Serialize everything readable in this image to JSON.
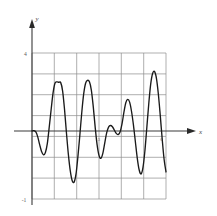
{
  "figure": {
    "background_color": "#ffffff",
    "curve_color": "#1a1a1a",
    "grid_color": "#8d8d8d",
    "axis_color": "#3a3a3a",
    "axis_labels": {
      "x": "x",
      "y": "y"
    },
    "tick_labels": {
      "y_top": "4",
      "y_bottom": "-1",
      "x_mid": "3",
      "x_right": "6"
    }
  },
  "chart_data": {
    "type": "line",
    "title": "",
    "subtitle": "",
    "xlabel": "x",
    "ylabel": "y",
    "xlim": [
      0,
      7
    ],
    "ylim": [
      -1,
      4
    ],
    "grid": true,
    "legend_position": "none",
    "x_ticks": [
      0,
      1,
      2,
      3,
      4,
      5,
      6,
      7
    ],
    "x_tick_labels": [
      "",
      "",
      "",
      "3",
      "",
      "",
      "6",
      ""
    ],
    "y_ticks": [
      -1,
      0,
      1,
      2,
      3,
      4
    ],
    "y_tick_labels": [
      "-1",
      "",
      "",
      "",
      "",
      "4"
    ],
    "annotations": [
      {
        "text": "3",
        "x": 3,
        "y": -0.22
      },
      {
        "text": "6",
        "x": 6,
        "y": -0.22
      },
      {
        "text": "4",
        "x": -0.22,
        "y": 4
      },
      {
        "text": "-1",
        "x": -0.3,
        "y": -1
      }
    ],
    "series": [
      {
        "name": "f(x)",
        "x": [
          0.0,
          0.1,
          0.2,
          0.3,
          0.4,
          0.5,
          0.6,
          0.7,
          0.8,
          0.9,
          1.0,
          1.1,
          1.2,
          1.3,
          1.4,
          1.5,
          1.6,
          1.7,
          1.8,
          1.9,
          2.0,
          2.1,
          2.2,
          2.3,
          2.4,
          2.5,
          2.6,
          2.7,
          2.8,
          2.9,
          3.0,
          3.1,
          3.2,
          3.3,
          3.4,
          3.5,
          3.6,
          3.7,
          3.8,
          3.9,
          4.0,
          4.1,
          4.2,
          4.3,
          4.4,
          4.5,
          4.6,
          4.7,
          4.8,
          4.9,
          5.0,
          5.1,
          5.2,
          5.3,
          5.4,
          5.5,
          5.6,
          5.7,
          5.8,
          5.9,
          6.0,
          6.1,
          6.2,
          6.3,
          6.4,
          6.5,
          6.6,
          6.7,
          6.8,
          6.9,
          7.0
        ],
        "y": [
          0.0,
          0.02,
          -0.05,
          -0.3,
          -0.7,
          -1.05,
          -1.22,
          -1.1,
          -0.65,
          0.2,
          1.1,
          1.95,
          2.45,
          2.52,
          2.5,
          2.48,
          2.05,
          1.1,
          -0.1,
          -1.2,
          -2.05,
          -2.55,
          -2.62,
          -2.2,
          -1.3,
          -0.2,
          0.95,
          1.9,
          2.45,
          2.6,
          2.52,
          2.1,
          1.25,
          0.2,
          -0.7,
          -1.25,
          -1.4,
          -1.15,
          -0.62,
          -0.1,
          0.2,
          0.28,
          0.22,
          0.05,
          -0.12,
          -0.18,
          -0.05,
          0.35,
          0.95,
          1.45,
          1.62,
          1.48,
          1.0,
          0.3,
          -0.55,
          -1.4,
          -2.0,
          -2.2,
          -1.85,
          -1.0,
          0.2,
          1.4,
          2.4,
          2.95,
          3.05,
          2.7,
          1.9,
          0.8,
          -0.4,
          -1.45,
          -2.1
        ]
      }
    ]
  }
}
